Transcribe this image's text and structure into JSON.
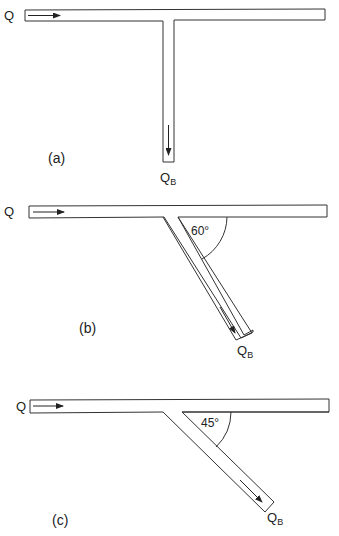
{
  "figure": {
    "panels": [
      {
        "id": "a",
        "caption": "(a)",
        "inlet_label": "Q",
        "branch_label_main": "Q",
        "branch_label_sub": "B",
        "branch_angle_deg": 90,
        "angle_label": ""
      },
      {
        "id": "b",
        "caption": "(b)",
        "inlet_label": "Q",
        "branch_label_main": "Q",
        "branch_label_sub": "B",
        "branch_angle_deg": 60,
        "angle_label": "60°"
      },
      {
        "id": "c",
        "caption": "(c)",
        "inlet_label": "Q",
        "branch_label_main": "Q",
        "branch_label_sub": "B",
        "branch_angle_deg": 45,
        "angle_label": "45°"
      }
    ],
    "colors": {
      "stroke": "#333333",
      "text": "#222222",
      "background": "#ffffff"
    }
  }
}
